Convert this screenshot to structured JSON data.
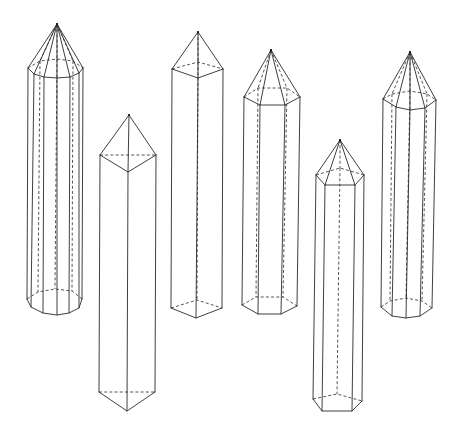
{
  "figure": {
    "line_color": "#2a2a2a",
    "background": "#ffffff"
  },
  "solids": [
    {
      "name": "dodecagonal-prism",
      "apex": [
        57,
        24
      ],
      "top": {
        "visible": [
          [
            28,
            68
          ],
          [
            34,
            74
          ],
          [
            44,
            77
          ],
          [
            57,
            78
          ],
          [
            70,
            77
          ],
          [
            79,
            73
          ],
          [
            83,
            68
          ]
        ],
        "hidden": [
          [
            28,
            68
          ],
          [
            40,
            61
          ],
          [
            57,
            59
          ],
          [
            73,
            61
          ],
          [
            83,
            68
          ]
        ]
      },
      "bottom": {
        "visible": [
          [
            27,
            299
          ],
          [
            31,
            307
          ],
          [
            43,
            313
          ],
          [
            57,
            315
          ],
          [
            69,
            313
          ],
          [
            79,
            308
          ],
          [
            82,
            299
          ]
        ],
        "hidden": [
          [
            27,
            299
          ],
          [
            38,
            292
          ],
          [
            55,
            289
          ],
          [
            72,
            291
          ],
          [
            82,
            299
          ]
        ]
      }
    },
    {
      "name": "triangular-prism",
      "apex": [
        129,
        115
      ],
      "top": {
        "visible": [
          [
            100,
            155
          ],
          [
            128,
            172
          ],
          [
            156,
            155
          ]
        ],
        "hidden": [
          [
            100,
            155
          ],
          [
            156,
            155
          ]
        ]
      },
      "bottom": {
        "visible": [
          [
            99,
            392
          ],
          [
            127,
            411
          ],
          [
            155,
            392
          ]
        ],
        "hidden": [
          [
            99,
            392
          ],
          [
            155,
            392
          ]
        ]
      }
    },
    {
      "name": "square-prism",
      "apex": [
        198,
        32
      ],
      "top": {
        "visible": [
          [
            172,
            69
          ],
          [
            198,
            78
          ],
          [
            223,
            69
          ]
        ],
        "hidden": [
          [
            172,
            69
          ],
          [
            198,
            62
          ],
          [
            223,
            69
          ]
        ]
      },
      "bottom": {
        "visible": [
          [
            171,
            308
          ],
          [
            196,
            318
          ],
          [
            222,
            308
          ]
        ],
        "hidden": [
          [
            171,
            308
          ],
          [
            197,
            300
          ],
          [
            222,
            308
          ]
        ]
      }
    },
    {
      "name": "hexagonal-prism",
      "apex": [
        271,
        50
      ],
      "top": {
        "visible": [
          [
            244,
            97
          ],
          [
            260,
            105
          ],
          [
            285,
            105
          ],
          [
            300,
            97
          ]
        ],
        "hidden": [
          [
            244,
            97
          ],
          [
            258,
            88
          ],
          [
            287,
            88
          ],
          [
            300,
            97
          ]
        ]
      },
      "bottom": {
        "visible": [
          [
            242,
            305
          ],
          [
            258,
            314
          ],
          [
            281,
            314
          ],
          [
            297,
            306
          ]
        ],
        "hidden": [
          [
            242,
            305
          ],
          [
            256,
            297
          ],
          [
            283,
            297
          ],
          [
            297,
            306
          ]
        ]
      }
    },
    {
      "name": "pentagonal-prism",
      "apex": [
        340,
        140
      ],
      "top": {
        "visible": [
          [
            316,
            175
          ],
          [
            325,
            185
          ],
          [
            355,
            185
          ],
          [
            364,
            175
          ]
        ],
        "hidden": [
          [
            316,
            175
          ],
          [
            340,
            168
          ],
          [
            364,
            175
          ]
        ]
      },
      "bottom": {
        "visible": [
          [
            313,
            399
          ],
          [
            322,
            411
          ],
          [
            352,
            411
          ],
          [
            362,
            401
          ]
        ],
        "hidden": [
          [
            313,
            399
          ],
          [
            337,
            394
          ],
          [
            362,
            401
          ]
        ]
      }
    },
    {
      "name": "octagonal-prism",
      "apex": [
        410,
        52
      ],
      "top": {
        "visible": [
          [
            383,
            99
          ],
          [
            396,
            107
          ],
          [
            410,
            110
          ],
          [
            425,
            108
          ],
          [
            436,
            100
          ]
        ],
        "hidden": [
          [
            383,
            99
          ],
          [
            392,
            94
          ],
          [
            410,
            91
          ],
          [
            427,
            94
          ],
          [
            436,
            100
          ]
        ]
      },
      "bottom": {
        "visible": [
          [
            381,
            307
          ],
          [
            392,
            316
          ],
          [
            406,
            318
          ],
          [
            420,
            316
          ],
          [
            432,
            308
          ]
        ],
        "hidden": [
          [
            381,
            307
          ],
          [
            390,
            301
          ],
          [
            406,
            298
          ],
          [
            422,
            301
          ],
          [
            432,
            308
          ]
        ]
      }
    }
  ]
}
